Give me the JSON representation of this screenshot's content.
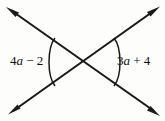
{
  "figure": {
    "type": "geometry-diagram",
    "background_color": "#fdfdfc",
    "stroke_color": "#1a1a1a",
    "width": 165,
    "height": 121
  },
  "labels": {
    "left": {
      "full_text": "4a − 2",
      "coefficient": "4",
      "variable": "a",
      "operator": "−",
      "constant": "2"
    },
    "right": {
      "full_text": "3a + 4",
      "coefficient": "3",
      "variable": "a",
      "operator": "+",
      "constant": "4"
    }
  },
  "geometry": {
    "intersection": {
      "x": 85,
      "y": 62
    },
    "lines": [
      {
        "name": "line-up-right",
        "from": {
          "x": 10,
          "y": 113
        },
        "to": {
          "x": 158,
          "y": 8
        },
        "arrow_start": true,
        "arrow_end": true
      },
      {
        "name": "line-down-right",
        "from": {
          "x": 8,
          "y": 9
        },
        "to": {
          "x": 157,
          "y": 114
        },
        "arrow_start": true,
        "arrow_end": true
      }
    ],
    "arcs": [
      {
        "name": "left-angle-arc",
        "from": {
          "x": 53,
          "y": 39
        },
        "to": {
          "x": 53,
          "y": 85
        },
        "bulge": "left"
      },
      {
        "name": "right-angle-arc",
        "from": {
          "x": 116,
          "y": 39
        },
        "to": {
          "x": 116,
          "y": 85
        },
        "bulge": "right"
      }
    ],
    "arrowheads": [
      {
        "name": "arrowhead-top-left",
        "x": 8,
        "y": 9
      },
      {
        "name": "arrowhead-top-right",
        "x": 158,
        "y": 8
      },
      {
        "name": "arrowhead-bottom-left",
        "x": 10,
        "y": 113
      },
      {
        "name": "arrowhead-bottom-right",
        "x": 157,
        "y": 114
      }
    ]
  }
}
